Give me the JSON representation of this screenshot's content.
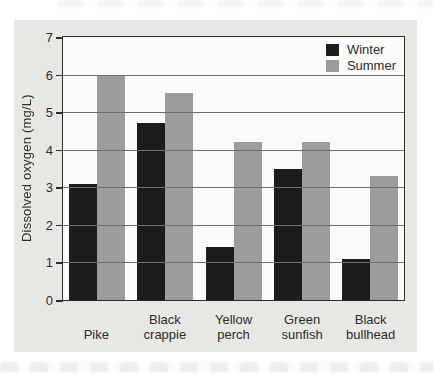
{
  "figure": {
    "background": "#e7e7e3"
  },
  "chart_data": {
    "type": "bar",
    "categories": [
      "Pike",
      "Black crappie",
      "Yellow perch",
      "Green sunfish",
      "Black bullhead"
    ],
    "series": [
      {
        "name": "Winter",
        "color": "#1c1c1c",
        "values": [
          3.1,
          4.7,
          1.4,
          3.5,
          1.1
        ]
      },
      {
        "name": "Summer",
        "color": "#9c9c9c",
        "values": [
          6.0,
          5.5,
          4.2,
          4.2,
          3.3
        ]
      }
    ],
    "title": "",
    "xlabel": "",
    "ylabel": "Dissolved oxygen (mg/L)",
    "ylim": [
      0,
      7
    ],
    "yticks": [
      0,
      1,
      2,
      3,
      4,
      5,
      6,
      7
    ],
    "grid": true,
    "gridline_values": [
      1,
      2,
      3,
      4,
      5,
      6
    ],
    "legend_position": "top-right",
    "plot_background": "#fbfbf9",
    "gridline_color": "#6e6e6e",
    "frame_color": "#2d2d2d",
    "text_color": "#2e2e2e"
  }
}
